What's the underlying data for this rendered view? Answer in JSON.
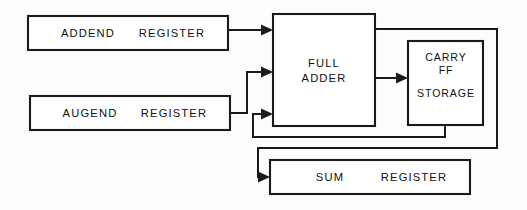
{
  "diagram": {
    "canvas": {
      "width": 527,
      "height": 210
    },
    "colors": {
      "background": "#fdfdfb",
      "line": "#1a1a1a",
      "box_fill": "#ffffff",
      "text": "#111111"
    },
    "boxes": [
      {
        "id": "addend-register",
        "label_primary": "ADDEND",
        "label_secondary": "REGISTER",
        "x": 28,
        "y": 16,
        "w": 200,
        "h": 34
      },
      {
        "id": "augend-register",
        "label_primary": "AUGEND",
        "label_secondary": "REGISTER",
        "x": 30,
        "y": 96,
        "w": 200,
        "h": 34
      },
      {
        "id": "full-adder",
        "label_line1": "FULL",
        "label_line2": "ADDER",
        "x": 273,
        "y": 14,
        "w": 102,
        "h": 112
      },
      {
        "id": "carry-ff-storage",
        "label_line1": "CARRY",
        "label_line2": "FF",
        "label_line3": "STORAGE",
        "x": 408,
        "y": 41,
        "w": 75,
        "h": 84
      },
      {
        "id": "sum-register",
        "label_primary": "SUM",
        "label_secondary": "REGISTER",
        "x": 270,
        "y": 160,
        "w": 200,
        "h": 34
      }
    ],
    "connections": [
      {
        "id": "addend-to-adder",
        "from": "addend-register",
        "to": "full-adder",
        "arrow": true
      },
      {
        "id": "augend-to-adder",
        "from": "augend-register",
        "to": "full-adder",
        "arrow": true
      },
      {
        "id": "carry-feedback-to-adder",
        "from": "carry-ff-storage",
        "to": "full-adder",
        "arrow": true
      },
      {
        "id": "adder-carry-out-to-carry-ff",
        "from": "full-adder",
        "to": "carry-ff-storage",
        "arrow": true
      },
      {
        "id": "adder-sum-out-to-sum-register",
        "from": "full-adder",
        "to": "sum-register",
        "arrow": true
      }
    ]
  }
}
